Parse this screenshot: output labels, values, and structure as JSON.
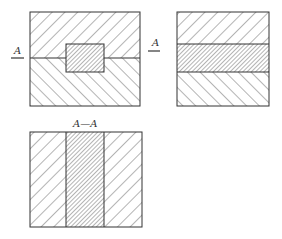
{
  "diagram": {
    "type": "engineering-section-drawing",
    "views": [
      {
        "name": "front-view",
        "description": "Rectangular part split horizontally into upper and lower halves with a small rectangular insert in the center"
      },
      {
        "name": "side-view",
        "description": "Rectangular part with a horizontal band through the middle"
      },
      {
        "name": "section-view",
        "description": "Section A-A showing a vertical band between two side regions"
      }
    ],
    "labels": {
      "cut_mark_left": "A",
      "cut_mark_right": "A",
      "section_title": "A—A"
    },
    "colors": {
      "line": "#333333",
      "background": "#ffffff"
    }
  }
}
